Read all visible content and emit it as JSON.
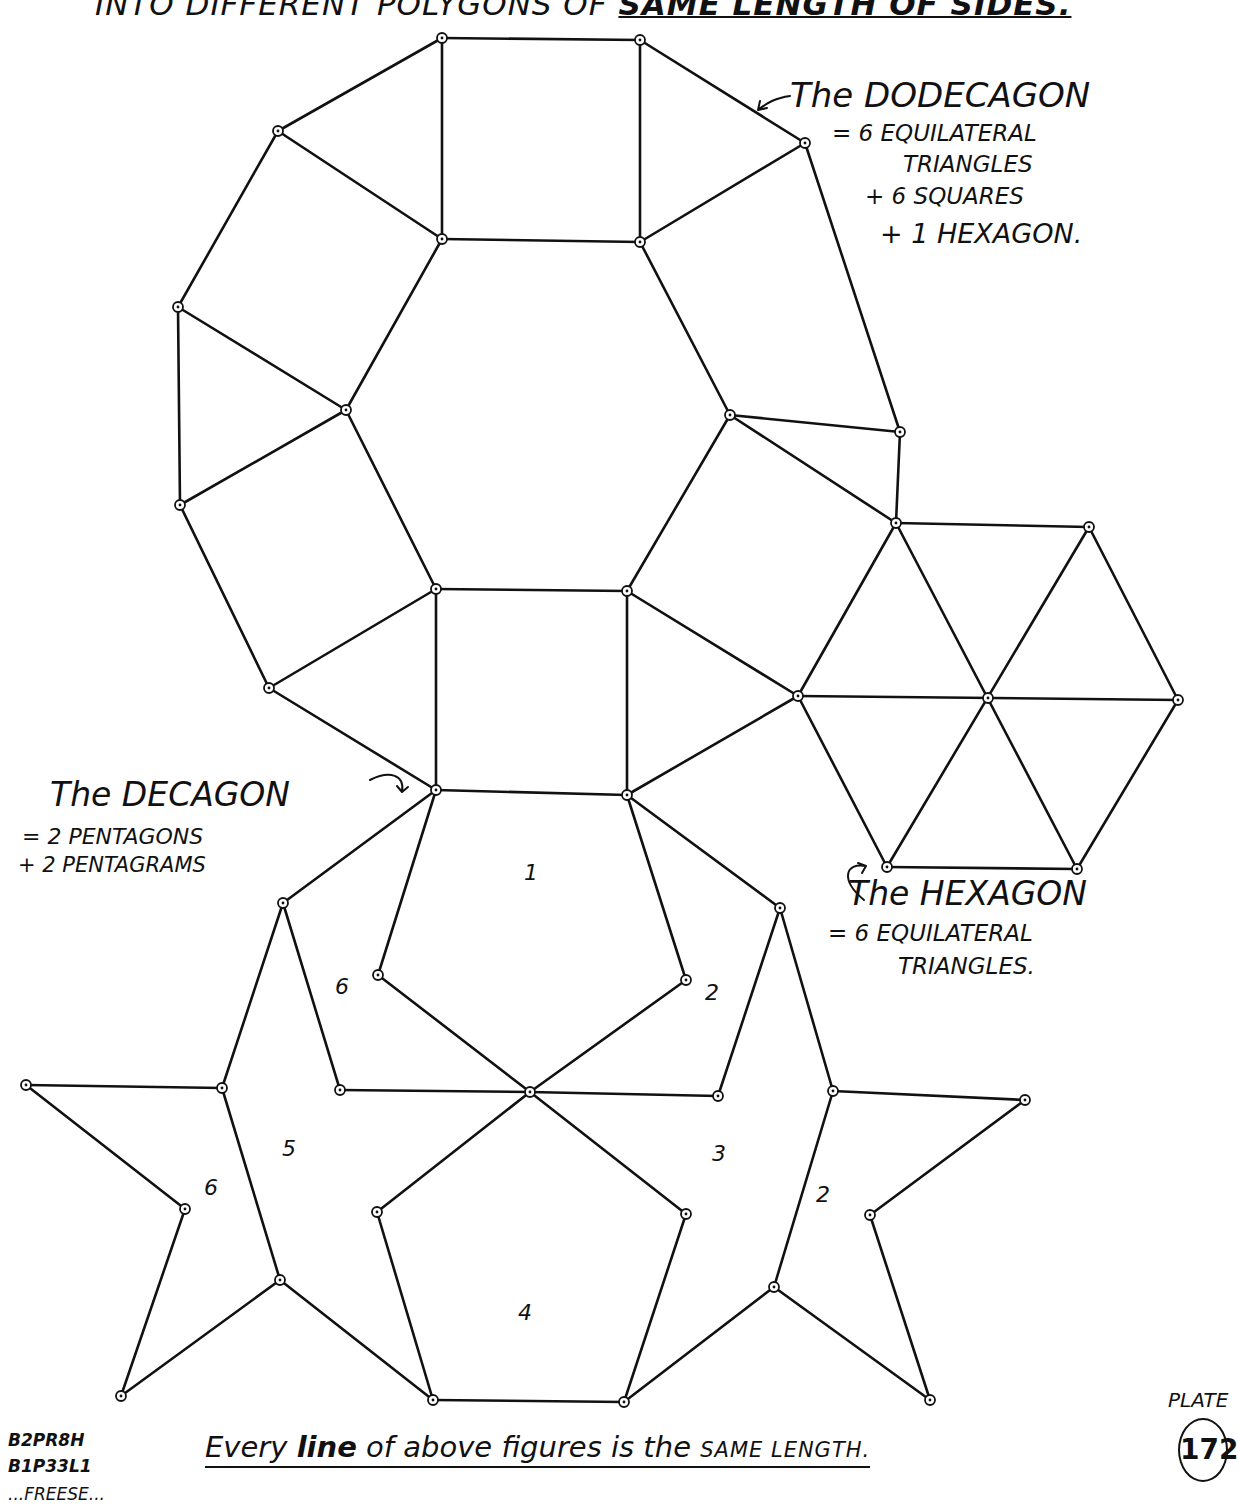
{
  "header": {
    "title_prefix": "INTO DIFFERENT POLYGONS OF ",
    "title_emphasis": "SAME LENGTH OF SIDES."
  },
  "annotations": {
    "dodecagon": {
      "line1": "The DODECAGON",
      "line2": "= 6 EQUILATERAL",
      "line3": "TRIANGLES",
      "line4": "+ 6 SQUARES",
      "line5": "+ 1 HEXAGON."
    },
    "decagon": {
      "line1": "The DECAGON",
      "line2": "= 2 PENTAGONS",
      "line3": "+ 2 PENTAGRAMS"
    },
    "hexagon": {
      "line1": "The HEXAGON",
      "line2": "= 6 EQUILATERAL",
      "line3": "TRIANGLES."
    }
  },
  "region_numbers": {
    "n1": "1",
    "n2_top": "2",
    "n6_top": "6",
    "n5": "5",
    "n3": "3",
    "n6_left": "6",
    "n2_right": "2",
    "n4": "4"
  },
  "footer": {
    "part1": "Every ",
    "part2": "line",
    "part3": " of above figures is the ",
    "part4": "SAME LENGTH."
  },
  "codes": {
    "line1": "B2PR8H",
    "line2": "B1P33L1",
    "line3": "...FREESE..."
  },
  "plate": {
    "label": "PLATE",
    "number": "172"
  },
  "colors": {
    "ink": "#111111",
    "paper": "#ffffff"
  },
  "diagram": {
    "segments": [
      [
        442,
        38,
        640,
        40
      ],
      [
        640,
        40,
        805,
        143
      ],
      [
        805,
        143,
        900,
        432
      ],
      [
        900,
        432,
        896,
        523
      ],
      [
        896,
        523,
        798,
        696
      ],
      [
        798,
        696,
        627,
        795
      ],
      [
        627,
        795,
        436,
        790
      ],
      [
        436,
        790,
        269,
        688
      ],
      [
        269,
        688,
        180,
        505
      ],
      [
        180,
        505,
        178,
        307
      ],
      [
        178,
        307,
        278,
        131
      ],
      [
        278,
        131,
        442,
        38
      ],
      [
        442,
        38,
        442,
        239
      ],
      [
        640,
        40,
        640,
        242
      ],
      [
        442,
        239,
        640,
        242
      ],
      [
        640,
        242,
        805,
        143
      ],
      [
        640,
        242,
        730,
        415
      ],
      [
        730,
        415,
        900,
        432
      ],
      [
        730,
        415,
        896,
        523
      ],
      [
        730,
        415,
        627,
        591
      ],
      [
        627,
        591,
        798,
        696
      ],
      [
        627,
        591,
        627,
        795
      ],
      [
        627,
        591,
        436,
        589
      ],
      [
        436,
        589,
        436,
        790
      ],
      [
        436,
        589,
        269,
        688
      ],
      [
        436,
        589,
        346,
        410
      ],
      [
        346,
        410,
        180,
        505
      ],
      [
        346,
        410,
        178,
        307
      ],
      [
        346,
        410,
        442,
        239
      ],
      [
        442,
        239,
        278,
        131
      ],
      [
        896,
        523,
        1089,
        527
      ],
      [
        1089,
        527,
        1178,
        700
      ],
      [
        1178,
        700,
        1077,
        869
      ],
      [
        1077,
        869,
        887,
        867
      ],
      [
        887,
        867,
        798,
        696
      ],
      [
        798,
        696,
        1178,
        700
      ],
      [
        896,
        523,
        1077,
        869
      ],
      [
        1089,
        527,
        887,
        867
      ],
      [
        627,
        795,
        686,
        980
      ],
      [
        686,
        980,
        530,
        1092
      ],
      [
        530,
        1092,
        378,
        975
      ],
      [
        378,
        975,
        436,
        790
      ],
      [
        436,
        790,
        283,
        903
      ],
      [
        627,
        795,
        780,
        908
      ],
      [
        283,
        903,
        222,
        1088
      ],
      [
        283,
        903,
        340,
        1090
      ],
      [
        340,
        1090,
        530,
        1092
      ],
      [
        530,
        1092,
        718,
        1096
      ],
      [
        780,
        908,
        718,
        1096
      ],
      [
        780,
        908,
        833,
        1091
      ],
      [
        26,
        1085,
        222,
        1088
      ],
      [
        26,
        1085,
        185,
        1209
      ],
      [
        185,
        1209,
        121,
        1396
      ],
      [
        121,
        1396,
        280,
        1280
      ],
      [
        222,
        1088,
        280,
        1280
      ],
      [
        280,
        1280,
        433,
        1400
      ],
      [
        530,
        1092,
        377,
        1212
      ],
      [
        377,
        1212,
        433,
        1400
      ],
      [
        433,
        1400,
        624,
        1402
      ],
      [
        530,
        1092,
        686,
        1214
      ],
      [
        686,
        1214,
        624,
        1402
      ],
      [
        624,
        1402,
        774,
        1287
      ],
      [
        774,
        1287,
        833,
        1091
      ],
      [
        774,
        1287,
        930,
        1400
      ],
      [
        930,
        1400,
        870,
        1215
      ],
      [
        870,
        1215,
        1025,
        1100
      ],
      [
        1025,
        1100,
        833,
        1091
      ]
    ],
    "vertices": [
      [
        442,
        38
      ],
      [
        640,
        40
      ],
      [
        805,
        143
      ],
      [
        900,
        432
      ],
      [
        896,
        523
      ],
      [
        798,
        696
      ],
      [
        627,
        795
      ],
      [
        436,
        790
      ],
      [
        269,
        688
      ],
      [
        180,
        505
      ],
      [
        178,
        307
      ],
      [
        278,
        131
      ],
      [
        442,
        239
      ],
      [
        640,
        242
      ],
      [
        730,
        415
      ],
      [
        627,
        591
      ],
      [
        436,
        589
      ],
      [
        346,
        410
      ],
      [
        1089,
        527
      ],
      [
        1178,
        700
      ],
      [
        1077,
        869
      ],
      [
        887,
        867
      ],
      [
        988,
        698
      ],
      [
        686,
        980
      ],
      [
        530,
        1092
      ],
      [
        378,
        975
      ],
      [
        283,
        903
      ],
      [
        780,
        908
      ],
      [
        340,
        1090
      ],
      [
        718,
        1096
      ],
      [
        222,
        1088
      ],
      [
        833,
        1091
      ],
      [
        26,
        1085
      ],
      [
        185,
        1209
      ],
      [
        121,
        1396
      ],
      [
        280,
        1280
      ],
      [
        377,
        1212
      ],
      [
        433,
        1400
      ],
      [
        624,
        1402
      ],
      [
        686,
        1214
      ],
      [
        774,
        1287
      ],
      [
        930,
        1400
      ],
      [
        870,
        1215
      ],
      [
        1025,
        1100
      ]
    ]
  }
}
